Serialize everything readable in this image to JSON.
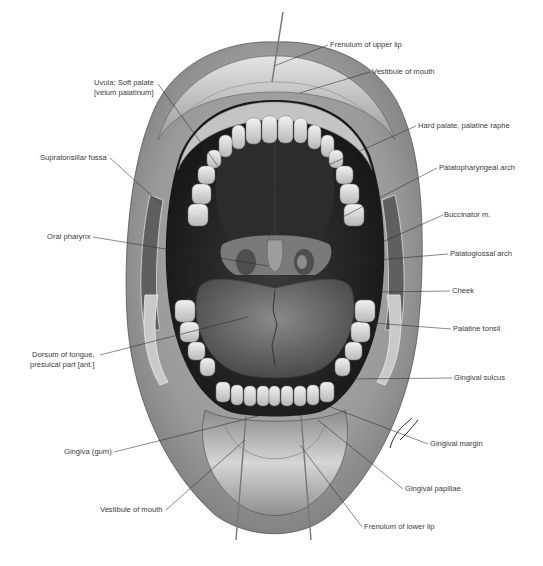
{
  "figure": {
    "signature": "Lemire"
  },
  "labels": [
    {
      "id": "frenulum-upper-lip",
      "text": "Frenulum of upper lip",
      "x": 330,
      "y": 40,
      "side": "right",
      "target": [
        274,
        66
      ]
    },
    {
      "id": "vestibule-mouth-top",
      "text": "Vestibule of mouth",
      "x": 372,
      "y": 67,
      "side": "right",
      "target": [
        300,
        93
      ]
    },
    {
      "id": "uvula-soft-palate",
      "lines": [
        "Uvula; Soft palate",
        "[velum palatinum]"
      ],
      "x": 94,
      "y": 78,
      "side": "left",
      "target": [
        270,
        237
      ]
    },
    {
      "id": "hard-palate-raphe",
      "text": "Hard palate, palatine raphe",
      "x": 418,
      "y": 121,
      "side": "right",
      "target": [
        272,
        190
      ]
    },
    {
      "id": "supratonsillar-fossa",
      "text": "Supratonsillar fossa",
      "x": 40,
      "y": 153,
      "side": "left",
      "target": [
        162,
        205
      ]
    },
    {
      "id": "palatopharyngeal-arch",
      "text": "Palatopharyngeal arch",
      "x": 439,
      "y": 163,
      "side": "right",
      "target": [
        310,
        234
      ]
    },
    {
      "id": "buccinator-m",
      "text": "Buccinator m.",
      "x": 444,
      "y": 210,
      "side": "right",
      "target": [
        380,
        243
      ]
    },
    {
      "id": "oral-pharynx",
      "text": "Oral pharynx",
      "x": 47,
      "y": 232,
      "side": "left",
      "target": [
        268,
        266
      ]
    },
    {
      "id": "palatoglossal-arch",
      "text": "Palatoglossal arch",
      "x": 450,
      "y": 249,
      "side": "right",
      "target": [
        330,
        264
      ]
    },
    {
      "id": "cheek",
      "text": "Cheek",
      "x": 452,
      "y": 286,
      "side": "right",
      "target": [
        380,
        292
      ]
    },
    {
      "id": "palatine-tonsil",
      "text": "Palatine tonsil",
      "x": 453,
      "y": 324,
      "side": "right",
      "target": [
        360,
        322
      ]
    },
    {
      "id": "dorsum-tongue",
      "lines": [
        "Dorsum of tongue,",
        "presulcal part [ant.]"
      ],
      "x": 30,
      "y": 350,
      "side": "left",
      "target": [
        248,
        317
      ]
    },
    {
      "id": "gingival-sulcus",
      "text": "Gingival sulcus",
      "x": 454,
      "y": 373,
      "side": "right",
      "target": [
        352,
        379
      ]
    },
    {
      "id": "gingiva-gum",
      "text": "Gingiva (gum)",
      "x": 64,
      "y": 447,
      "side": "left",
      "target": [
        262,
        415
      ]
    },
    {
      "id": "gingival-margin",
      "text": "Gingival margin",
      "x": 430,
      "y": 439,
      "side": "right",
      "target": [
        320,
        403
      ]
    },
    {
      "id": "gingival-papillae",
      "text": "Gingival papillae",
      "x": 405,
      "y": 484,
      "side": "right",
      "target": [
        318,
        420
      ]
    },
    {
      "id": "vestibule-mouth-bottom",
      "text": "Vestibule of mouth",
      "x": 100,
      "y": 505,
      "side": "left",
      "target": [
        245,
        440
      ]
    },
    {
      "id": "frenulum-lower-lip",
      "text": "Frenulum of lower lip",
      "x": 364,
      "y": 522,
      "side": "right",
      "target": [
        300,
        445
      ]
    }
  ],
  "colors": {
    "background": "#ffffff",
    "label_text": "#3a3a3a",
    "leader_line": "#2a2a2a",
    "lip_light": "#d8d8d8",
    "lip_mid": "#a9a9a9",
    "skin_dark": "#6e6e6e",
    "cavity": "#1e1e1e",
    "teeth": "#e6e6e6",
    "tongue": "#6a6a6a"
  }
}
